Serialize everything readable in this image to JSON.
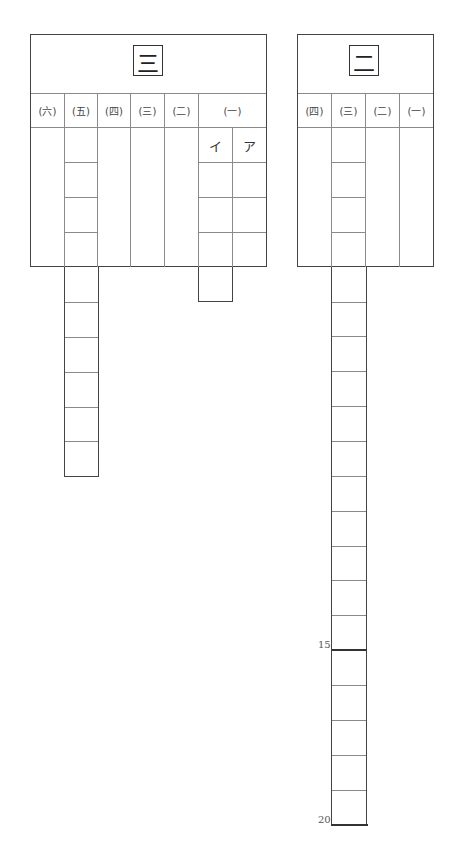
{
  "sheets": [
    {
      "id": "section-3",
      "title": "三",
      "columns": [
        {
          "label": "(六)",
          "type": "blank"
        },
        {
          "label": "(五)",
          "type": "character-grid",
          "cells": 10
        },
        {
          "label": "(四)",
          "type": "blank"
        },
        {
          "label": "(三)",
          "type": "blank"
        },
        {
          "label": "(二)",
          "type": "blank"
        },
        {
          "label": "(一)",
          "type": "sub-columns",
          "sub_labels": [
            "イ",
            "ア"
          ],
          "cells_per_sub": [
            4,
            3
          ]
        }
      ]
    },
    {
      "id": "section-2",
      "title": "二",
      "columns": [
        {
          "label": "(四)",
          "type": "blank"
        },
        {
          "label": "(三)",
          "type": "character-grid",
          "cells": 20,
          "markers": [
            "15",
            "20"
          ]
        },
        {
          "label": "(二)",
          "type": "blank"
        },
        {
          "label": "(一)",
          "type": "blank"
        }
      ]
    }
  ],
  "colors": {
    "line": "#8a8a8a",
    "frame": "#444444",
    "background": "#ffffff"
  }
}
